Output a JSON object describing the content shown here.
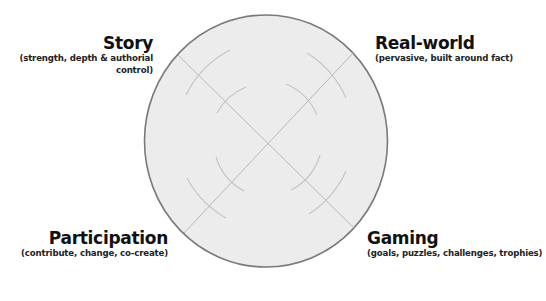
{
  "diagram": {
    "type": "quadrant-circle",
    "circle": {
      "fill": "#ececec",
      "stroke": "#7a7a7a",
      "cx": 266,
      "cy": 141,
      "rx": 122,
      "ry": 126
    },
    "axis_line_color": "#b8b8b8",
    "arc_color": "#c2c2c2"
  },
  "quadrants": {
    "top_left": {
      "title": "Story",
      "subtitle": "(strength, depth & authorial control)"
    },
    "top_right": {
      "title": "Real-world",
      "subtitle": "(pervasive, built around fact)"
    },
    "bottom_left": {
      "title": "Participation",
      "subtitle": "(contribute, change, co-create)"
    },
    "bottom_right": {
      "title": "Gaming",
      "subtitle": "(goals, puzzles, challenges, trophies)"
    }
  }
}
